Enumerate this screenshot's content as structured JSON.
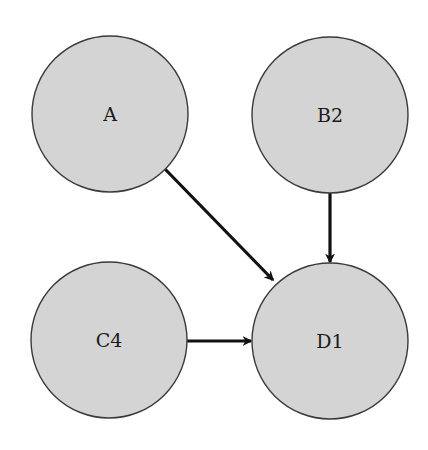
{
  "diagram": {
    "type": "directed-graph",
    "colors": {
      "node_fill": "#d4d4d4",
      "node_stroke": "#3a3a3a",
      "edge": "#111111",
      "background": "#ffffff"
    },
    "nodes": [
      {
        "id": "A",
        "label": "A",
        "cx": 110,
        "cy": 114,
        "r": 78
      },
      {
        "id": "B2",
        "label": "B2",
        "cx": 330,
        "cy": 115,
        "r": 78
      },
      {
        "id": "C4",
        "label": "C4",
        "cx": 109,
        "cy": 340,
        "r": 78
      },
      {
        "id": "D1",
        "label": "D1",
        "cx": 330,
        "cy": 341,
        "r": 78
      }
    ],
    "edges": [
      {
        "from": "A",
        "to": "D1"
      },
      {
        "from": "B2",
        "to": "D1"
      },
      {
        "from": "C4",
        "to": "D1"
      }
    ]
  }
}
